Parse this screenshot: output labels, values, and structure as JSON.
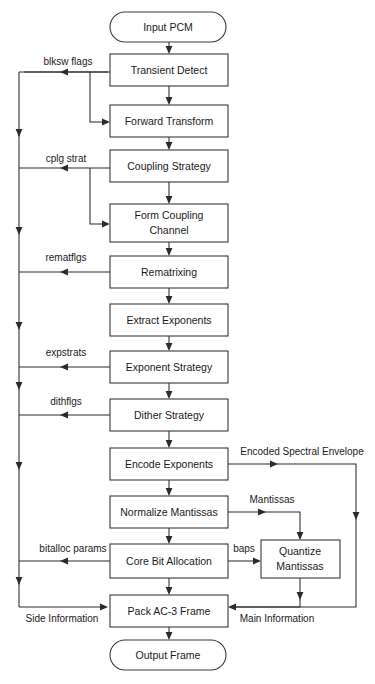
{
  "diagram": {
    "colors": {
      "background": "#ffffff",
      "box_fill": "#ffffff",
      "box_stroke": "#3a3a3a",
      "line": "#2b2b2b",
      "text": "#1a1a1a"
    },
    "nodes": [
      {
        "id": "input_pcm",
        "label": "Input PCM",
        "shape": "terminator",
        "x": 110,
        "y": 12,
        "w": 116,
        "h": 30
      },
      {
        "id": "transient_detect",
        "label": "Transient Detect",
        "shape": "process",
        "x": 110,
        "y": 54,
        "w": 118,
        "h": 32
      },
      {
        "id": "forward_transform",
        "label": "Forward Transform",
        "shape": "process",
        "x": 110,
        "y": 105,
        "w": 118,
        "h": 32
      },
      {
        "id": "coupling_strategy",
        "label": "Coupling Strategy",
        "shape": "process",
        "x": 110,
        "y": 150,
        "w": 118,
        "h": 32
      },
      {
        "id": "form_coupling",
        "label": "Form Coupling\nChannel",
        "shape": "process",
        "x": 110,
        "y": 204,
        "w": 118,
        "h": 38
      },
      {
        "id": "rematrixing",
        "label": "Rematrixing",
        "shape": "process",
        "x": 110,
        "y": 256,
        "w": 118,
        "h": 32
      },
      {
        "id": "extract_exponents",
        "label": "Extract Exponents",
        "shape": "process",
        "x": 110,
        "y": 304,
        "w": 118,
        "h": 32
      },
      {
        "id": "exponent_strategy",
        "label": "Exponent Strategy",
        "shape": "process",
        "x": 110,
        "y": 351,
        "w": 118,
        "h": 32
      },
      {
        "id": "dither_strategy",
        "label": "Dither Strategy",
        "shape": "process",
        "x": 110,
        "y": 399,
        "w": 118,
        "h": 32
      },
      {
        "id": "encode_exponents",
        "label": "Encode Exponents",
        "shape": "process",
        "x": 110,
        "y": 448,
        "w": 118,
        "h": 32
      },
      {
        "id": "normalize_mantissas",
        "label": "Normalize Mantissas",
        "shape": "process",
        "x": 110,
        "y": 496,
        "w": 118,
        "h": 32
      },
      {
        "id": "core_bit_allocation",
        "label": "Core Bit Allocation",
        "shape": "process",
        "x": 110,
        "y": 544,
        "w": 118,
        "h": 34
      },
      {
        "id": "quantize_mantissas",
        "label": "Quantize\nMantissas",
        "shape": "process",
        "x": 261,
        "y": 540,
        "w": 79,
        "h": 38
      },
      {
        "id": "pack_frame",
        "label": "Pack AC-3 Frame",
        "shape": "process",
        "x": 110,
        "y": 595,
        "w": 118,
        "h": 32
      },
      {
        "id": "output_frame",
        "label": "Output Frame",
        "shape": "terminator",
        "x": 110,
        "y": 640,
        "w": 116,
        "h": 30
      }
    ],
    "edge_labels": [
      {
        "id": "blksw_flags",
        "text": "blksw flags",
        "x": 68,
        "y": 62
      },
      {
        "id": "cplg_strat",
        "text": "cplg strat",
        "x": 66,
        "y": 159
      },
      {
        "id": "rematflgs",
        "text": "rematflgs",
        "x": 66,
        "y": 258
      },
      {
        "id": "expstrats",
        "text": "expstrats",
        "x": 66,
        "y": 353
      },
      {
        "id": "dithflgs",
        "text": "dithflgs",
        "x": 66,
        "y": 402
      },
      {
        "id": "bitalloc_params",
        "text": "bitalloc params",
        "x": 73,
        "y": 549
      },
      {
        "id": "encoded_spectral_envelope",
        "text": "Encoded Spectral Envelope",
        "x": 302,
        "y": 452
      },
      {
        "id": "mantissas",
        "text": "Mantissas",
        "x": 272,
        "y": 500
      },
      {
        "id": "baps",
        "text": "baps",
        "x": 244,
        "y": 549
      },
      {
        "id": "side_information",
        "text": "Side Information",
        "x": 62,
        "y": 618
      },
      {
        "id": "main_information",
        "text": "Main Information",
        "x": 277,
        "y": 618
      }
    ],
    "flow_sequence": [
      "Input PCM",
      "Transient Detect",
      "Forward Transform",
      "Coupling Strategy",
      "Form Coupling Channel",
      "Rematrixing",
      "Extract Exponents",
      "Exponent Strategy",
      "Dither Strategy",
      "Encode Exponents",
      "Normalize Mantissas",
      "Core Bit Allocation",
      "Pack AC-3 Frame",
      "Output Frame"
    ]
  }
}
